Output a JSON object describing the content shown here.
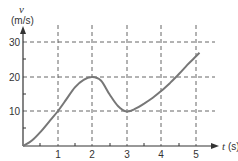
{
  "chart_data": {
    "type": "line",
    "title": "",
    "xlabel": "t (s)",
    "ylabel": "v (m/s)",
    "x_var": "t",
    "x_unit": "(s)",
    "y_var": "v",
    "y_unit": "(m/s)",
    "xlim": [
      0,
      5.4
    ],
    "ylim": [
      0,
      33
    ],
    "x_ticks": [
      "1",
      "2",
      "3",
      "4",
      "5"
    ],
    "y_ticks": [
      "10",
      "20",
      "30"
    ],
    "grid": "dashed",
    "legend": "none",
    "series": [
      {
        "name": "v(t)",
        "x": [
          0,
          0.25,
          0.5,
          0.75,
          1.0,
          1.25,
          1.5,
          1.75,
          2.0,
          2.25,
          2.5,
          2.75,
          3.0,
          3.25,
          3.5,
          3.75,
          4.0,
          4.25,
          4.5,
          4.75,
          5.0,
          5.1
        ],
        "values": [
          0,
          1.5,
          4.0,
          7.0,
          10.0,
          13.5,
          17.0,
          19.2,
          20.0,
          19.0,
          15.0,
          11.5,
          10.0,
          10.8,
          12.3,
          14.0,
          16.0,
          18.3,
          20.8,
          23.5,
          26.0,
          27.0
        ]
      }
    ]
  }
}
